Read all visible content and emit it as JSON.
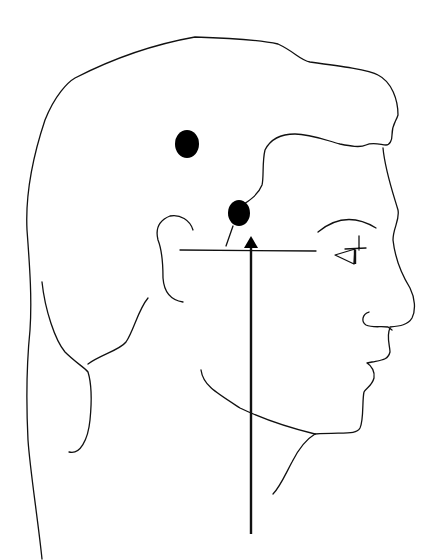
{
  "diagram": {
    "title": "",
    "colors": {
      "line": "#111111",
      "marker": "#000000",
      "background": "#ffffff"
    },
    "markers": [
      {
        "name": "upper-marker",
        "cx": 187,
        "cy": 144
      },
      {
        "name": "lower-marker",
        "cx": 239,
        "cy": 213
      }
    ],
    "horizontal_line": {
      "x1": 180,
      "y1": 250,
      "x2": 316,
      "y2": 251
    },
    "vertical_arrow": {
      "x": 251,
      "y_bottom": 534,
      "y_tip": 236,
      "direction": "up"
    }
  }
}
